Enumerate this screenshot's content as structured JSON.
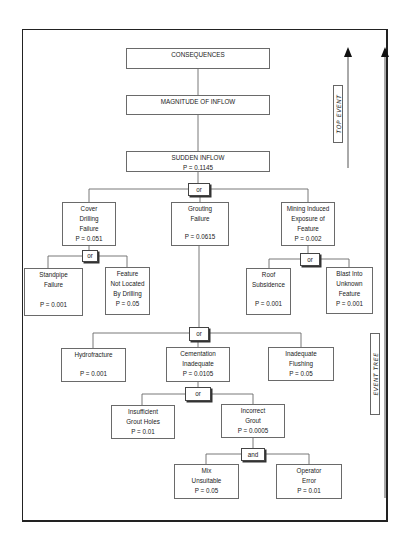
{
  "diagram": {
    "type": "fault-tree / event-tree",
    "top_nodes": {
      "consequences": "CONSEQUENCES",
      "magnitude": "MAGNITUDE OF INFLOW",
      "sudden_inflow": {
        "title": "SUDDEN INFLOW",
        "p": "P = 0.1145"
      }
    },
    "gates": {
      "g_top": "or",
      "g_cover": "or",
      "g_mining": "or",
      "g_grouting": "or",
      "g_cementation": "or",
      "g_incorrect": "and"
    },
    "nodes": {
      "cover_drilling": {
        "lines": [
          "Cover",
          "Drilling",
          "Failure"
        ],
        "p": "P = 0.051"
      },
      "grouting": {
        "lines": [
          "Grouting",
          "Failure"
        ],
        "p": "P = 0.0615"
      },
      "mining_induced": {
        "lines": [
          "Mining Induced",
          "Exposure of",
          "Feature"
        ],
        "p": "P = 0.002"
      },
      "standpipe": {
        "lines": [
          "Standpipe",
          "Failure"
        ],
        "p": "P = 0.001"
      },
      "feature_not_located": {
        "lines": [
          "Feature",
          "Not Located",
          "By Drilling"
        ],
        "p": "P = 0.05"
      },
      "roof_subsidence": {
        "lines": [
          "Roof",
          "Subsidence"
        ],
        "p": "P = 0.001"
      },
      "blast_into": {
        "lines": [
          "Blast Into",
          "Unknown",
          "Feature"
        ],
        "p": "P = 0.001"
      },
      "hydrofracture": {
        "lines": [
          "Hydrofracture"
        ],
        "p": "P = 0.001"
      },
      "cementation": {
        "lines": [
          "Cementation",
          "Inadequate"
        ],
        "p": "P = 0.0105"
      },
      "inadequate_flushing": {
        "lines": [
          "Inadequate",
          "Flushing"
        ],
        "p": "P = 0.05"
      },
      "insufficient_holes": {
        "lines": [
          "Insufficient",
          "Grout Holes"
        ],
        "p": "P = 0.01"
      },
      "incorrect_grout": {
        "lines": [
          "Incorrect",
          "Grout"
        ],
        "p": "P = 0.0005"
      },
      "mix_unsuitable": {
        "lines": [
          "Mix",
          "Unsuitable"
        ],
        "p": "P = 0.05"
      },
      "operator_error": {
        "lines": [
          "Operator",
          "Error"
        ],
        "p": "P = 0.01"
      }
    },
    "side_labels": {
      "top_event": "TOP EVENT",
      "event_tree": "EVENT TREE"
    },
    "colors": {
      "line": "#6a6a6a",
      "frame": "#222222",
      "background": "#ffffff"
    }
  }
}
